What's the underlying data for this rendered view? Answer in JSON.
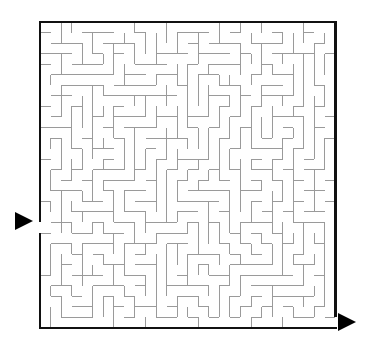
{
  "figure": {
    "kind": "maze-puzzle",
    "title": "",
    "background_color": "#ffffff"
  },
  "maze": {
    "grid": {
      "columns": 28,
      "rows": 29,
      "cell_size": 10.55,
      "origin_x": 40,
      "origin_y": 22,
      "width": 295.4,
      "height": 305.95
    },
    "style": {
      "border_color": "#111111",
      "border_width": 2.6,
      "wall_color": "#9a9a9a",
      "wall_width": 1,
      "passage_color": "#ffffff"
    },
    "entrance": {
      "label": "entrance",
      "side": "left",
      "cell_row": 19,
      "gap_y": 222.5,
      "arrow_points": "15,212 33,221 15,230",
      "arrow_color": "#000000"
    },
    "exit": {
      "label": "exit",
      "side": "right",
      "cell_row": 28,
      "gap_y": 317.5,
      "arrow_points": "338,313 356,322 338,331",
      "arrow_color": "#000000"
    },
    "generator": {
      "algorithm": "recursive-backtracker",
      "seed": 20240917
    }
  }
}
